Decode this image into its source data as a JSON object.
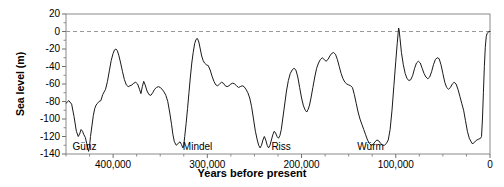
{
  "chart_data": {
    "type": "line",
    "title": "",
    "xlabel": "Years before present",
    "ylabel": "Sea level (m)",
    "xlim": [
      450000,
      0
    ],
    "ylim": [
      -140,
      20
    ],
    "x_reversed": true,
    "grid": false,
    "legend": "none",
    "zero_reference_line": {
      "value": 0,
      "style": "dashed",
      "color": "#999999"
    },
    "y_ticks": [
      20,
      0,
      -20,
      -40,
      -60,
      -80,
      -100,
      -120,
      -140
    ],
    "y_tick_labels": [
      "20",
      "0",
      "-20",
      "-40",
      "-60",
      "-80",
      "-100",
      "-120",
      "-140"
    ],
    "y_minor_tick_step": 10,
    "x_ticks": [
      400000,
      300000,
      200000,
      100000,
      0
    ],
    "x_tick_labels": [
      "400,000",
      "300,000",
      "200,000",
      "100,000",
      "0"
    ],
    "x_minor_tick_step": 25000,
    "annotations": [
      {
        "text": "Günz",
        "x": 443000,
        "y": -133
      },
      {
        "text": "Mindel",
        "x": 326000,
        "y": -133
      },
      {
        "text": "Riss",
        "x": 232000,
        "y": -133
      },
      {
        "text": "Würm",
        "x": 141000,
        "y": -133
      }
    ],
    "line_color": "#1a1a1a",
    "line_width": 1,
    "series": [
      {
        "name": "Sea level",
        "points": [
          [
            450000,
            -82
          ],
          [
            447000,
            -79
          ],
          [
            444000,
            -83
          ],
          [
            441500,
            -97
          ],
          [
            439000,
            -114
          ],
          [
            437000,
            -120
          ],
          [
            435500,
            -117
          ],
          [
            434000,
            -112
          ],
          [
            432500,
            -114
          ],
          [
            431000,
            -118
          ],
          [
            429500,
            -121
          ],
          [
            428000,
            -128
          ],
          [
            427000,
            -133
          ],
          [
            426000,
            -137
          ],
          [
            425000,
            -131
          ],
          [
            424000,
            -120
          ],
          [
            422500,
            -108
          ],
          [
            421000,
            -96
          ],
          [
            419500,
            -88
          ],
          [
            418000,
            -84
          ],
          [
            416500,
            -82
          ],
          [
            415000,
            -80
          ],
          [
            413000,
            -79
          ],
          [
            411000,
            -72
          ],
          [
            409500,
            -69
          ],
          [
            408000,
            -66
          ],
          [
            406000,
            -57
          ],
          [
            404000,
            -45
          ],
          [
            402000,
            -33
          ],
          [
            400000,
            -25
          ],
          [
            398500,
            -21
          ],
          [
            397000,
            -20
          ],
          [
            395500,
            -22
          ],
          [
            394000,
            -27
          ],
          [
            392000,
            -36
          ],
          [
            390000,
            -46
          ],
          [
            388000,
            -55
          ],
          [
            386000,
            -61
          ],
          [
            384000,
            -63
          ],
          [
            382000,
            -62
          ],
          [
            380000,
            -61
          ],
          [
            378000,
            -59
          ],
          [
            376000,
            -58
          ],
          [
            374000,
            -60
          ],
          [
            372000,
            -66
          ],
          [
            370500,
            -71
          ],
          [
            369000,
            -63
          ],
          [
            367500,
            -57
          ],
          [
            366000,
            -61
          ],
          [
            364000,
            -68
          ],
          [
            362000,
            -72
          ],
          [
            360000,
            -73
          ],
          [
            358000,
            -70
          ],
          [
            356000,
            -66
          ],
          [
            354000,
            -64
          ],
          [
            352000,
            -63
          ],
          [
            350000,
            -64
          ],
          [
            348000,
            -66
          ],
          [
            346000,
            -69
          ],
          [
            344000,
            -73
          ],
          [
            342000,
            -80
          ],
          [
            340000,
            -92
          ],
          [
            338000,
            -106
          ],
          [
            336500,
            -118
          ],
          [
            335000,
            -126
          ],
          [
            333000,
            -130
          ],
          [
            331000,
            -128
          ],
          [
            329000,
            -126
          ],
          [
            327500,
            -129
          ],
          [
            326000,
            -133
          ],
          [
            325000,
            -130
          ],
          [
            324000,
            -120
          ],
          [
            322500,
            -105
          ],
          [
            321000,
            -88
          ],
          [
            319500,
            -70
          ],
          [
            318000,
            -52
          ],
          [
            316500,
            -36
          ],
          [
            315000,
            -24
          ],
          [
            313500,
            -14
          ],
          [
            312000,
            -9
          ],
          [
            310500,
            -8
          ],
          [
            309000,
            -12
          ],
          [
            307500,
            -20
          ],
          [
            306000,
            -28
          ],
          [
            304500,
            -33
          ],
          [
            303000,
            -36
          ],
          [
            301000,
            -38
          ],
          [
            299000,
            -39
          ],
          [
            297000,
            -44
          ],
          [
            295000,
            -51
          ],
          [
            293000,
            -57
          ],
          [
            291000,
            -61
          ],
          [
            289000,
            -62
          ],
          [
            287000,
            -60
          ],
          [
            285000,
            -58
          ],
          [
            283000,
            -59
          ],
          [
            281000,
            -62
          ],
          [
            279000,
            -63
          ],
          [
            277000,
            -62
          ],
          [
            275000,
            -60
          ],
          [
            273000,
            -59
          ],
          [
            271000,
            -60
          ],
          [
            269000,
            -62
          ],
          [
            267000,
            -64
          ],
          [
            265000,
            -63
          ],
          [
            263000,
            -62
          ],
          [
            261000,
            -63
          ],
          [
            259000,
            -66
          ],
          [
            257000,
            -70
          ],
          [
            255000,
            -76
          ],
          [
            253000,
            -86
          ],
          [
            251000,
            -100
          ],
          [
            249000,
            -114
          ],
          [
            247000,
            -124
          ],
          [
            245500,
            -130
          ],
          [
            244000,
            -133
          ],
          [
            242500,
            -130
          ],
          [
            241000,
            -124
          ],
          [
            239500,
            -120
          ],
          [
            238000,
            -124
          ],
          [
            236500,
            -130
          ],
          [
            235000,
            -133
          ],
          [
            233500,
            -130
          ],
          [
            232000,
            -124
          ],
          [
            230500,
            -118
          ],
          [
            229000,
            -114
          ],
          [
            227500,
            -116
          ],
          [
            226000,
            -120
          ],
          [
            224500,
            -122
          ],
          [
            223000,
            -119
          ],
          [
            221500,
            -112
          ],
          [
            220000,
            -100
          ],
          [
            218000,
            -84
          ],
          [
            216000,
            -68
          ],
          [
            214000,
            -56
          ],
          [
            212000,
            -48
          ],
          [
            210000,
            -44
          ],
          [
            208000,
            -42
          ],
          [
            206000,
            -44
          ],
          [
            204000,
            -52
          ],
          [
            202000,
            -64
          ],
          [
            200000,
            -76
          ],
          [
            198000,
            -85
          ],
          [
            196000,
            -90
          ],
          [
            194500,
            -92
          ],
          [
            193000,
            -89
          ],
          [
            191500,
            -84
          ],
          [
            190000,
            -76
          ],
          [
            188000,
            -64
          ],
          [
            186000,
            -52
          ],
          [
            184000,
            -42
          ],
          [
            182000,
            -36
          ],
          [
            180000,
            -32
          ],
          [
            178000,
            -30
          ],
          [
            176000,
            -32
          ],
          [
            174000,
            -34
          ],
          [
            172000,
            -32
          ],
          [
            170000,
            -28
          ],
          [
            168000,
            -25
          ],
          [
            166000,
            -24
          ],
          [
            164000,
            -26
          ],
          [
            162000,
            -32
          ],
          [
            160000,
            -40
          ],
          [
            158000,
            -48
          ],
          [
            156000,
            -54
          ],
          [
            154000,
            -58
          ],
          [
            152000,
            -60
          ],
          [
            150000,
            -61
          ],
          [
            148000,
            -62
          ],
          [
            146000,
            -64
          ],
          [
            144000,
            -72
          ],
          [
            142000,
            -82
          ],
          [
            140000,
            -92
          ],
          [
            138000,
            -100
          ],
          [
            136000,
            -106
          ],
          [
            134000,
            -112
          ],
          [
            132000,
            -118
          ],
          [
            130000,
            -124
          ],
          [
            128000,
            -128
          ],
          [
            126000,
            -130
          ],
          [
            124000,
            -129
          ],
          [
            122000,
            -126
          ],
          [
            120000,
            -124
          ],
          [
            118000,
            -125
          ],
          [
            116000,
            -128
          ],
          [
            114000,
            -130
          ],
          [
            112000,
            -130
          ],
          [
            110000,
            -128
          ],
          [
            108000,
            -124
          ],
          [
            106000,
            -112
          ],
          [
            104000,
            -90
          ],
          [
            102000,
            -62
          ],
          [
            100000,
            -34
          ],
          [
            98500,
            -14
          ],
          [
            97500,
            -2
          ],
          [
            97000,
            4
          ],
          [
            96500,
            2
          ],
          [
            95500,
            -8
          ],
          [
            94000,
            -24
          ],
          [
            92000,
            -38
          ],
          [
            90000,
            -48
          ],
          [
            88000,
            -54
          ],
          [
            86000,
            -56
          ],
          [
            84000,
            -55
          ],
          [
            82000,
            -50
          ],
          [
            80000,
            -42
          ],
          [
            78000,
            -36
          ],
          [
            76000,
            -34
          ],
          [
            74000,
            -36
          ],
          [
            72000,
            -42
          ],
          [
            70000,
            -48
          ],
          [
            68000,
            -52
          ],
          [
            66000,
            -54
          ],
          [
            64000,
            -52
          ],
          [
            62000,
            -46
          ],
          [
            60000,
            -38
          ],
          [
            58000,
            -32
          ],
          [
            56000,
            -30
          ],
          [
            54000,
            -31
          ],
          [
            52000,
            -38
          ],
          [
            50000,
            -48
          ],
          [
            48000,
            -58
          ],
          [
            46000,
            -64
          ],
          [
            44000,
            -66
          ],
          [
            42000,
            -64
          ],
          [
            40000,
            -60
          ],
          [
            38000,
            -58
          ],
          [
            36000,
            -60
          ],
          [
            34000,
            -66
          ],
          [
            32000,
            -74
          ],
          [
            30000,
            -82
          ],
          [
            28000,
            -90
          ],
          [
            26000,
            -102
          ],
          [
            24000,
            -114
          ],
          [
            22000,
            -122
          ],
          [
            20000,
            -126
          ],
          [
            19000,
            -128
          ],
          [
            18000,
            -128
          ],
          [
            16000,
            -126
          ],
          [
            14000,
            -124
          ],
          [
            12000,
            -123
          ],
          [
            10000,
            -122
          ],
          [
            9000,
            -120
          ],
          [
            8000,
            -100
          ],
          [
            7000,
            -70
          ],
          [
            6000,
            -40
          ],
          [
            5000,
            -18
          ],
          [
            4000,
            -6
          ],
          [
            3000,
            -2
          ],
          [
            2000,
            -1
          ],
          [
            1000,
            0
          ],
          [
            0,
            0
          ]
        ]
      }
    ]
  }
}
